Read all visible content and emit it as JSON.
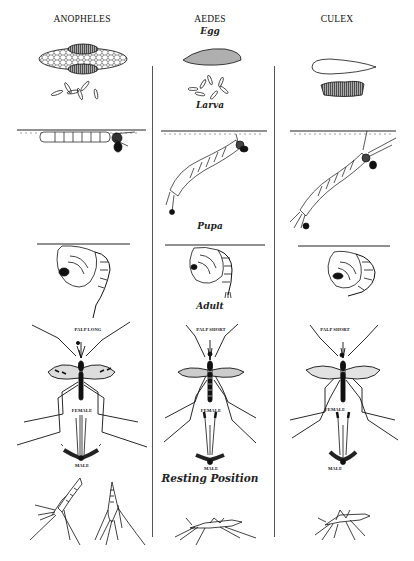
{
  "figure": {
    "columns": [
      {
        "name": "ANOPHELES",
        "palp_label": "PALP LONG",
        "female_label": "FEMALE",
        "male_label": "MALE"
      },
      {
        "name": "AEDES",
        "palp_label": "PALP SHORT",
        "female_label": "FEMALE",
        "male_label": "MALE"
      },
      {
        "name": "CULEX",
        "palp_label": "PALP SHORT",
        "female_label": "FEMALE",
        "male_label": "MALE"
      }
    ],
    "stages": {
      "egg": "Egg",
      "larva": "Larva",
      "pupa": "Pupa",
      "adult": "Adult",
      "resting": "Resting Position"
    },
    "colors": {
      "ink": "#111111",
      "divider": "#555555",
      "background": "#ffffff"
    }
  }
}
